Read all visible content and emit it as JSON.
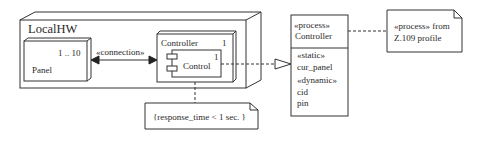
{
  "diagram": {
    "type": "uml-deployment",
    "nodes": {
      "localhw": {
        "name": "LocalHW"
      },
      "panel": {
        "name": "Panel",
        "multiplicity": "1 .. 10"
      },
      "controller": {
        "name": "Controller",
        "multiplicity": "1",
        "component": {
          "name": "Control",
          "multiplicity": "1"
        }
      }
    },
    "connection": {
      "stereotype": "«connection»"
    },
    "constraint_note": {
      "text": "{response_time < 1 sec. }"
    },
    "class_box": {
      "stereotype": "«process»",
      "name": "Controller",
      "attributes": [
        {
          "text": "«static»"
        },
        {
          "text": "cur_panel"
        },
        {
          "text": "«dynamic»"
        },
        {
          "text": "cid"
        },
        {
          "text": "pin"
        }
      ]
    },
    "profile_note": {
      "line1": "«process» from",
      "line2": "Z.109 profile"
    },
    "colors": {
      "line": "#333333",
      "background": "#ffffff"
    }
  }
}
